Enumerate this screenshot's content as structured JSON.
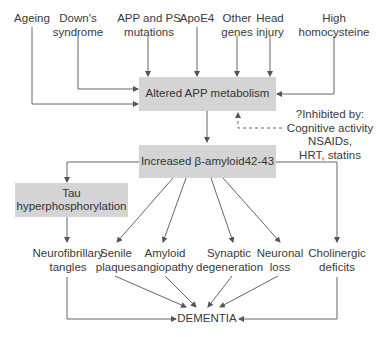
{
  "colors": {
    "box_fill": "#d4d4d4",
    "line": "#555555",
    "text": "#333333",
    "background": "#ffffff"
  },
  "risk_factors": [
    {
      "id": "ageing",
      "label": "Ageing"
    },
    {
      "id": "downs",
      "label": "Down's\nsyndrome"
    },
    {
      "id": "app_ps",
      "label": "APP and PS\nmutations"
    },
    {
      "id": "apoe4",
      "label": "ApoE4"
    },
    {
      "id": "other_genes",
      "label": "Other\ngenes"
    },
    {
      "id": "head_injury",
      "label": "Head\ninjury"
    },
    {
      "id": "homocysteine",
      "label": "High\nhomocysteine"
    }
  ],
  "nodes": {
    "altered_app": "Altered APP metabolism",
    "inhibitors": "?Inhibited by:\nCognitive activity\nNSAIDs,\nHRT, statins",
    "beta_amyloid": "Increased β-amyloid42-43",
    "tau": "Tau\nhyperphosphorylation",
    "dementia": "DEMENTIA"
  },
  "outcomes": [
    {
      "id": "nft",
      "label": "Neurofibrillary\ntangles"
    },
    {
      "id": "senile",
      "label": "Senile\nplaques"
    },
    {
      "id": "angiopathy",
      "label": "Amyloid\nangiopathy"
    },
    {
      "id": "synaptic",
      "label": "Synaptic\ndegeneration"
    },
    {
      "id": "neuronal",
      "label": "Neuronal\nloss"
    },
    {
      "id": "cholinergic",
      "label": "Cholinergic\ndeficits"
    }
  ],
  "edges": [
    {
      "from": "ageing",
      "to": "altered_app"
    },
    {
      "from": "downs",
      "to": "altered_app"
    },
    {
      "from": "app_ps",
      "to": "altered_app"
    },
    {
      "from": "apoe4",
      "to": "altered_app"
    },
    {
      "from": "other_genes",
      "to": "altered_app"
    },
    {
      "from": "head_injury",
      "to": "altered_app"
    },
    {
      "from": "homocysteine",
      "to": "altered_app"
    },
    {
      "from": "inhibitors",
      "to": "altered_app",
      "style": "dashed"
    },
    {
      "from": "altered_app",
      "to": "beta_amyloid"
    },
    {
      "from": "beta_amyloid",
      "to": "tau"
    },
    {
      "from": "beta_amyloid",
      "to": "senile"
    },
    {
      "from": "beta_amyloid",
      "to": "angiopathy"
    },
    {
      "from": "beta_amyloid",
      "to": "synaptic"
    },
    {
      "from": "beta_amyloid",
      "to": "neuronal"
    },
    {
      "from": "beta_amyloid",
      "to": "cholinergic"
    },
    {
      "from": "tau",
      "to": "nft"
    },
    {
      "from": "nft",
      "to": "dementia"
    },
    {
      "from": "senile",
      "to": "dementia"
    },
    {
      "from": "angiopathy",
      "to": "dementia"
    },
    {
      "from": "synaptic",
      "to": "dementia"
    },
    {
      "from": "neuronal",
      "to": "dementia"
    },
    {
      "from": "cholinergic",
      "to": "dementia"
    }
  ]
}
